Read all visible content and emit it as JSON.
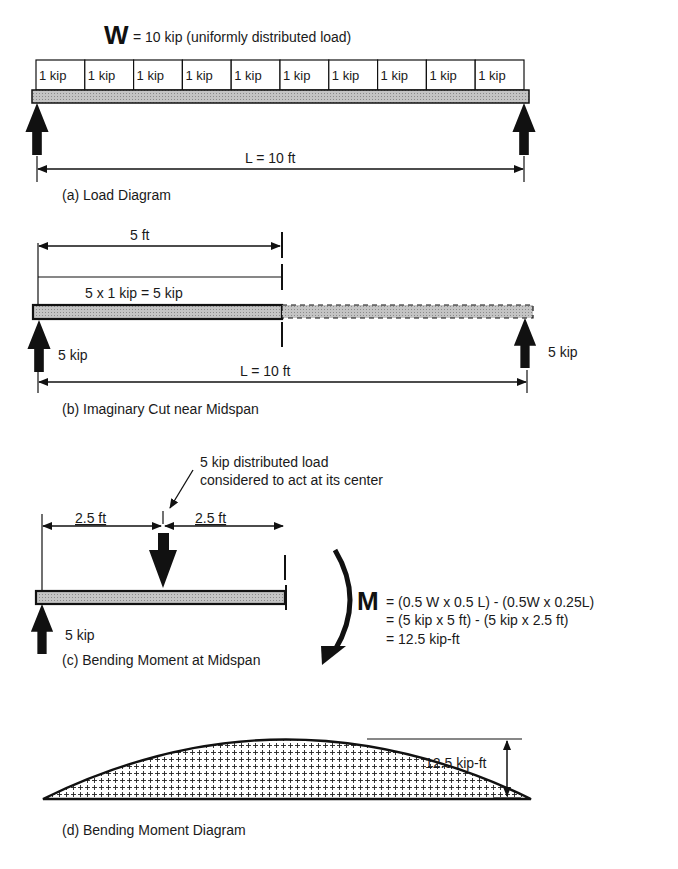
{
  "diagram": {
    "panel_a": {
      "title": "W",
      "title_rest": "= 10 kip (uniformly distributed load)",
      "segments": [
        "1 kip",
        "1 kip",
        "1 kip",
        "1 kip",
        "1 kip",
        "1 kip",
        "1 kip",
        "1 kip",
        "1 kip",
        "1 kip"
      ],
      "span_label": "L = 10 ft",
      "caption": "(a)  Load Diagram"
    },
    "panel_b": {
      "dim_label": "5 ft",
      "load_label": "5 x 1 kip = 5 kip",
      "left_reaction": "5 kip",
      "right_reaction": "5 kip",
      "span_label": "L = 10 ft",
      "caption": "(b)  Imaginary Cut near Midspan"
    },
    "panel_c": {
      "note_line1": "5 kip distributed load",
      "note_line2": "considered to act at its center",
      "dim_left": "2.5  ft",
      "dim_right": "2.5  ft",
      "reaction": "5 kip",
      "moment_symbol": "M",
      "eq_line1": "= (0.5 W x 0.5 L) - (0.5W x 0.25L)",
      "eq_line2": "= (5 kip x 5 ft) - (5 kip x 2.5 ft)",
      "eq_line3": "=  12.5  kip-ft",
      "caption": "(c)  Bending Moment at Midspan"
    },
    "panel_d": {
      "max_label": "12.5   kip-ft",
      "caption": "(d)  Bending Moment Diagram"
    },
    "colors": {
      "beam_fill": "#b8b8b8",
      "ink": "#111111",
      "background": "#ffffff"
    }
  }
}
